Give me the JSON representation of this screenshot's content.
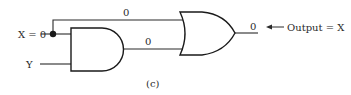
{
  "diagram": {
    "caption": "(c)",
    "inputs": {
      "x_label": "X = 0",
      "y_label": "Y"
    },
    "wires": {
      "top_wire_value": "0",
      "and_output_value": "0",
      "or_output_value": "0"
    },
    "output_annotation": {
      "arrow": "←",
      "label": "Output = X"
    },
    "gates": [
      {
        "type": "AND",
        "inputs": [
          "X",
          "Y"
        ],
        "output": "0"
      },
      {
        "type": "OR",
        "inputs": [
          "X",
          "AND output"
        ],
        "output": "0"
      }
    ],
    "colors": {
      "line": "#2a2a2a",
      "background": "#ffffff"
    }
  }
}
